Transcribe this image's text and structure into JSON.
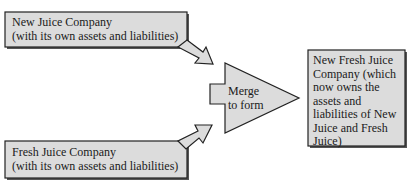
{
  "diagram": {
    "colors": {
      "fill": "#dcdcdc",
      "stroke": "#222222",
      "shadow": "#555555",
      "text": "#1a1a1a"
    },
    "nodes": {
      "new_juice": {
        "line1": "New Juice Company",
        "line2": "(with its own assets and liabilities)"
      },
      "fresh_juice": {
        "line1": "Fresh Juice Company",
        "line2": "(with its own assets and liabilities)"
      },
      "merge": {
        "line1": "Merge",
        "line2": "to form"
      },
      "result": {
        "lines": [
          "New Fresh Juice",
          "Company (which",
          "now owns the",
          "assets and",
          "liabilities of New",
          "Juice and Fresh",
          "Juice)"
        ]
      }
    },
    "edges": [
      {
        "from": "new_juice",
        "to": "merge"
      },
      {
        "from": "fresh_juice",
        "to": "merge"
      },
      {
        "from": "merge",
        "to": "result"
      }
    ]
  }
}
